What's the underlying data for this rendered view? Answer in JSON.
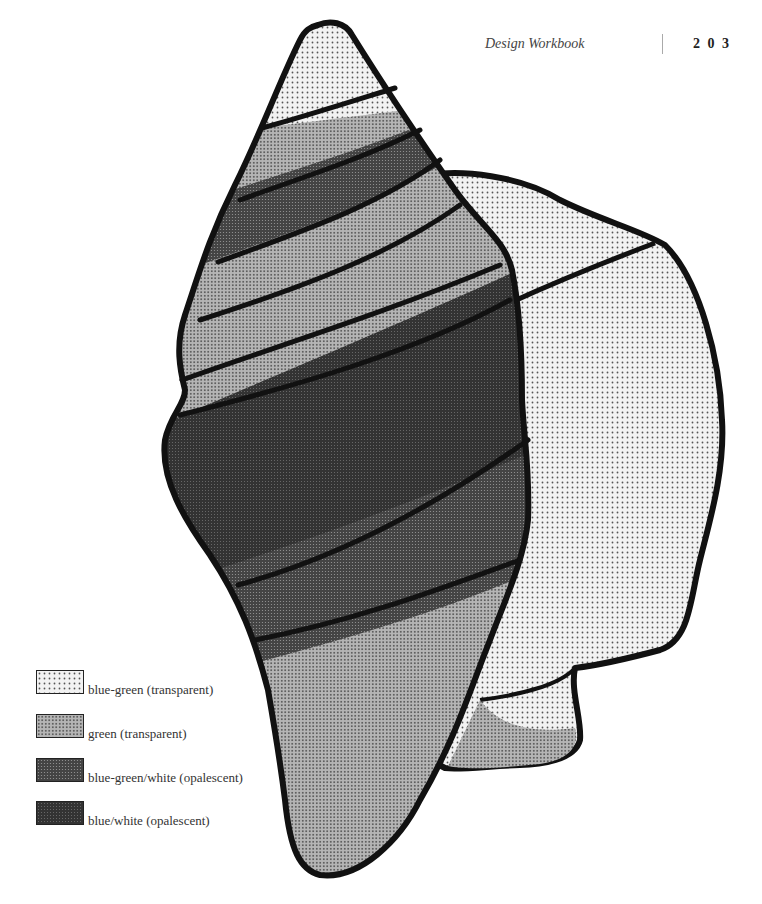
{
  "header": {
    "running_title": "Design Workbook",
    "page_number": "2 0 3"
  },
  "legend": {
    "items": [
      {
        "label": "blue-green (transparent)",
        "pattern": "light-dots"
      },
      {
        "label": "green (transparent)",
        "pattern": "medium-dots"
      },
      {
        "label": "blue-green/white (opalescent)",
        "pattern": "dark-dots"
      },
      {
        "label": "blue/white (opalescent)",
        "pattern": "darkest-dots"
      }
    ]
  },
  "figure": {
    "fills": {
      "light": "#e8e8e8",
      "medium": "#a8a8a8",
      "dark": "#555555",
      "darkest": "#3a3a3a",
      "outline": "#111111"
    }
  }
}
